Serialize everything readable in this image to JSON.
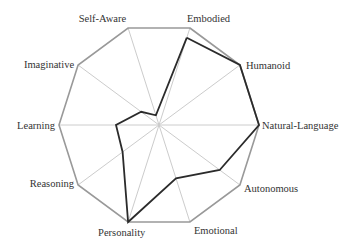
{
  "chart_data": {
    "type": "radar",
    "title": "",
    "axes": [
      "Embodied",
      "Humanoid",
      "Natural-Language",
      "Autonomous",
      "Emotional",
      "Personality",
      "Reasoning",
      "Learning",
      "Imaginative",
      "Self-Aware"
    ],
    "series": [
      {
        "name": "profile",
        "values": [
          0.9,
          1.0,
          1.0,
          0.75,
          0.55,
          1.0,
          0.45,
          0.43,
          0.22,
          0.1
        ]
      }
    ],
    "range": [
      0,
      1
    ],
    "grid": true,
    "legend": "none",
    "colors": {
      "outline": "#999999",
      "spokes": "#cccccc",
      "series": "#2b2b2b"
    }
  }
}
